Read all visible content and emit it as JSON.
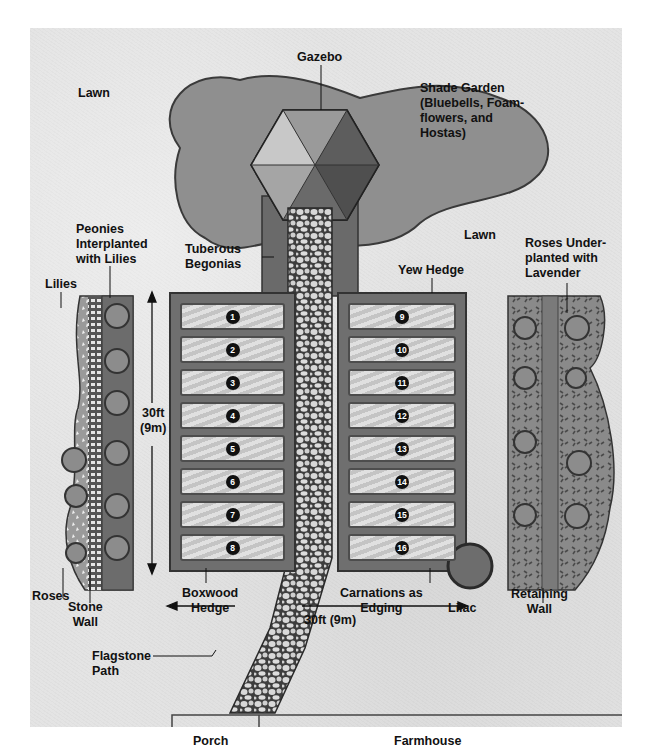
{
  "labels": {
    "gazebo": "Gazebo",
    "lawn_top": "Lawn",
    "shade_garden_1": "Shade Garden",
    "shade_garden_2": "(Bluebells, Foam-",
    "shade_garden_3": "flowers, and",
    "shade_garden_4": "Hostas)",
    "lawn_mid": "Lawn",
    "peonies_1": "Peonies",
    "peonies_2": "Interplanted",
    "peonies_3": "with Lilies",
    "tuberous_1": "Tuberous",
    "tuberous_2": "Begonias",
    "lilies": "Lilies",
    "yew_hedge": "Yew Hedge",
    "roses_under_1": "Roses Under-",
    "roses_under_2": "planted with",
    "roses_under_3": "Lavender",
    "dim_vertical_1": "30ft",
    "dim_vertical_2": "(9m)",
    "roses": "Roses",
    "stone_wall_1": "Stone",
    "stone_wall_2": "Wall",
    "boxwood_1": "Boxwood",
    "boxwood_2": "Hedge",
    "carnations_1": "Carnations as",
    "carnations_2": "Edging",
    "lilac": "Lilac",
    "retaining_1": "Retaining",
    "retaining_2": "Wall",
    "dim_horizontal": "30ft (9m)",
    "flagstone_1": "Flagstone",
    "flagstone_2": "Path",
    "porch": "Porch",
    "farmhouse": "Farmhouse"
  },
  "beds_left": [
    "1",
    "2",
    "3",
    "4",
    "5",
    "6",
    "7",
    "8"
  ],
  "beds_right": [
    "9",
    "10",
    "11",
    "12",
    "13",
    "14",
    "15",
    "16"
  ],
  "colors": {
    "lawn": "#e4e4e4",
    "shade_garden": "#8f8f8f",
    "hedge": "#6b6b6b",
    "bed": "#c9c9c9",
    "marker": "#111111"
  }
}
